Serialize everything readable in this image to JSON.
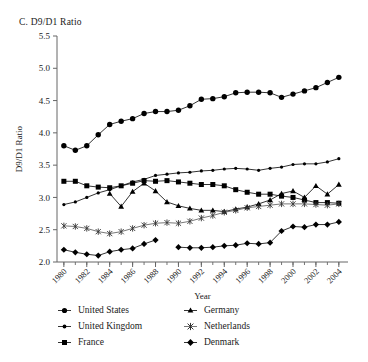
{
  "chart_data": {
    "type": "line",
    "title": "C. D9/D1 Ratio",
    "xlabel": "Year",
    "ylabel": "D9/D1 Ratio",
    "xlim": [
      1979.4,
      2004.8
    ],
    "ylim": [
      2.0,
      5.5
    ],
    "ytick_step": 0.5,
    "yticks": [
      "2.0",
      "2.5",
      "3.0",
      "3.5",
      "4.0",
      "4.5",
      "5.0",
      "5.5"
    ],
    "xticks_major": [
      "1980",
      "1982",
      "1984",
      "1986",
      "1988",
      "1990",
      "1992",
      "1994",
      "1996",
      "1998",
      "2000",
      "2002",
      "2004"
    ],
    "xticks_minor_every": 1,
    "grid": false,
    "legend_position": "below",
    "legend_columns": 2,
    "series": [
      {
        "name": "United States",
        "marker": "circle-large",
        "color": "#000000",
        "x": [
          1980,
          1981,
          1982,
          1983,
          1984,
          1985,
          1986,
          1987,
          1988,
          1989,
          1990,
          1991,
          1992,
          1993,
          1994,
          1995,
          1996,
          1997,
          1998,
          1999,
          2000,
          2001,
          2002,
          2003,
          2004
        ],
        "values": [
          3.8,
          3.73,
          3.8,
          3.97,
          4.13,
          4.18,
          4.22,
          4.3,
          4.33,
          4.33,
          4.35,
          4.42,
          4.52,
          4.53,
          4.56,
          4.62,
          4.63,
          4.63,
          4.62,
          4.55,
          4.6,
          4.65,
          4.7,
          4.78,
          4.86
        ]
      },
      {
        "name": "United Kingdom",
        "marker": "circle-small",
        "color": "#000000",
        "x": [
          1980,
          1981,
          1982,
          1983,
          1984,
          1985,
          1986,
          1987,
          1988,
          1989,
          1990,
          1991,
          1992,
          1993,
          1994,
          1995,
          1996,
          1997,
          1998,
          1999,
          2000,
          2001,
          2002,
          2003,
          2004
        ],
        "values": [
          2.89,
          2.93,
          3.0,
          3.07,
          3.12,
          3.18,
          3.24,
          3.28,
          3.34,
          3.36,
          3.38,
          3.39,
          3.41,
          3.42,
          3.44,
          3.45,
          3.44,
          3.42,
          3.45,
          3.47,
          3.51,
          3.52,
          3.52,
          3.55,
          3.6
        ]
      },
      {
        "name": "France",
        "marker": "square",
        "color": "#000000",
        "x": [
          1980,
          1981,
          1982,
          1983,
          1984,
          1985,
          1986,
          1987,
          1988,
          1989,
          1990,
          1991,
          1992,
          1993,
          1994,
          1995,
          1996,
          1997,
          1998,
          1999,
          2000,
          2001,
          2002,
          2003,
          2004
        ],
        "values": [
          3.25,
          3.25,
          3.18,
          3.16,
          3.15,
          3.18,
          3.22,
          3.26,
          3.25,
          3.26,
          3.24,
          3.22,
          3.2,
          3.2,
          3.18,
          3.12,
          3.08,
          3.05,
          3.05,
          3.02,
          3.0,
          2.96,
          2.92,
          2.92,
          2.91
        ]
      },
      {
        "name": "Germany",
        "marker": "triangle",
        "color": "#000000",
        "x": [
          1984,
          1985,
          1986,
          1987,
          1988,
          1989,
          1990,
          1991,
          1992,
          1993,
          1994,
          1995,
          1996,
          1997,
          1998,
          1999,
          2000,
          2001,
          2002,
          2003,
          2004
        ],
        "values": [
          3.06,
          2.86,
          3.09,
          3.22,
          3.1,
          2.93,
          2.87,
          2.83,
          2.8,
          2.8,
          2.78,
          2.82,
          2.85,
          2.9,
          2.96,
          3.06,
          3.1,
          3.0,
          3.18,
          3.05,
          3.2
        ]
      },
      {
        "name": "Netherlands",
        "marker": "asterisk",
        "color": "#555555",
        "x": [
          1980,
          1981,
          1982,
          1983,
          1984,
          1985,
          1986,
          1987,
          1988,
          1989,
          1990,
          1991,
          1992,
          1993,
          1994,
          1995,
          1996,
          1997,
          1998,
          1999,
          2000,
          2001,
          2002,
          2003,
          2004
        ],
        "values": [
          2.56,
          2.55,
          2.52,
          2.47,
          2.44,
          2.47,
          2.52,
          2.57,
          2.6,
          2.61,
          2.6,
          2.63,
          2.68,
          2.72,
          2.77,
          2.8,
          2.84,
          2.86,
          2.88,
          2.9,
          2.9,
          2.9,
          2.89,
          2.88,
          2.9
        ]
      },
      {
        "name": "Denmark",
        "marker": "diamond",
        "color": "#000000",
        "x": [
          1980,
          1981,
          1982,
          1983,
          1984,
          1985,
          1986,
          1987,
          1988,
          1990,
          1991,
          1992,
          1993,
          1994,
          1995,
          1996,
          1997,
          1998,
          1999,
          2000,
          2001,
          2002,
          2003,
          2004
        ],
        "values": [
          2.19,
          2.15,
          2.12,
          2.1,
          2.16,
          2.19,
          2.21,
          2.28,
          2.34,
          2.23,
          2.22,
          2.22,
          2.23,
          2.25,
          2.26,
          2.29,
          2.28,
          2.3,
          2.48,
          2.55,
          2.54,
          2.58,
          2.58,
          2.62
        ]
      }
    ]
  },
  "legend": {
    "items": [
      {
        "label": "United States",
        "marker": "circle-large"
      },
      {
        "label": "Germany",
        "marker": "triangle"
      },
      {
        "label": "United Kingdom",
        "marker": "circle-small"
      },
      {
        "label": "Netherlands",
        "marker": "asterisk"
      },
      {
        "label": "France",
        "marker": "square"
      },
      {
        "label": "Denmark",
        "marker": "diamond"
      }
    ]
  }
}
